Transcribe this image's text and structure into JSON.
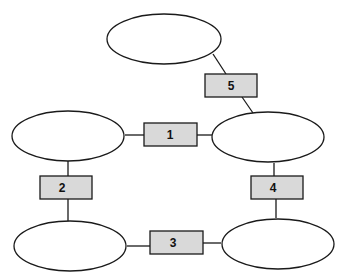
{
  "diagram": {
    "title": "",
    "colors": {
      "stroke": "#1a1a1a",
      "box_fill": "#d9d9d9",
      "ellipse_fill": "#ffffff"
    },
    "nodes": [
      {
        "id": "top",
        "label": ""
      },
      {
        "id": "middle-left",
        "label": ""
      },
      {
        "id": "middle-right",
        "label": ""
      },
      {
        "id": "bottom-left",
        "label": ""
      },
      {
        "id": "bottom-right",
        "label": ""
      }
    ],
    "connectors": [
      {
        "label": "1",
        "from": "middle-left",
        "to": "middle-right"
      },
      {
        "label": "2",
        "from": "middle-left",
        "to": "bottom-left"
      },
      {
        "label": "3",
        "from": "bottom-left",
        "to": "bottom-right"
      },
      {
        "label": "4",
        "from": "middle-right",
        "to": "bottom-right"
      },
      {
        "label": "5",
        "from": "top",
        "to": "middle-right"
      }
    ]
  }
}
